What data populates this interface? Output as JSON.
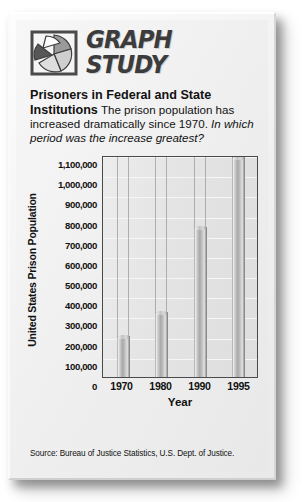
{
  "logo": {
    "icon": "pie-chart-icon",
    "line1": "GRAPH",
    "line2": "STUDY"
  },
  "headline": {
    "title": "Prisoners in Federal and State Institutions",
    "body": "The prison population has increased dramatically since 1970.",
    "question": "In which period was the increase greatest?"
  },
  "source": "Source: Bureau of Justice Statistics, U.S. Dept. of Justice.",
  "chart_data": {
    "type": "bar",
    "title": "Prisoners in Federal and State Institutions",
    "categories": [
      "1970",
      "1980",
      "1990",
      "1995"
    ],
    "values": [
      196000,
      316000,
      740000,
      1085000
    ],
    "xlabel": "Year",
    "ylabel": "United States Prison Population",
    "ylim": [
      0,
      1100000
    ],
    "ytick_labels": [
      "1,100,000",
      "1,000,000",
      "900,000",
      "800,000",
      "700,000",
      "600,000",
      "500,000",
      "400,000",
      "300,000",
      "200,000",
      "100,000",
      "0"
    ],
    "ytick_values": [
      1100000,
      1000000,
      900000,
      800000,
      700000,
      600000,
      500000,
      400000,
      300000,
      200000,
      100000,
      0
    ],
    "grid": true,
    "legend": "none",
    "bar_color": "#b4b4b4",
    "plot_border_color": "#4a4a4a"
  }
}
